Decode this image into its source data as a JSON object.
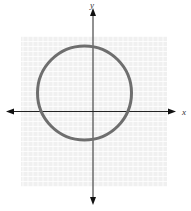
{
  "chart_data": {
    "type": "line",
    "title": "",
    "xlabel": "x",
    "ylabel": "y",
    "grid": true,
    "grid_extent_px": {
      "left": 21,
      "top": 36,
      "right": 167,
      "bottom": 187
    },
    "axes_origin_px": {
      "x": 93,
      "y": 111.5
    },
    "x_axis_px": {
      "from": 6,
      "to": 176
    },
    "y_axis_px": {
      "from": 8,
      "to": 205
    },
    "grid_minor_spacing_px": 5,
    "shape": {
      "kind": "circle",
      "center_px": {
        "x": 84.5,
        "y": 93
      },
      "radius_px": 47,
      "stroke": "#6e6e6e",
      "stroke_width": 3
    },
    "tick_labels": [],
    "legend": null
  },
  "labels": {
    "x": "x",
    "y": "y"
  },
  "colors": {
    "grid_bg": "#f0f0f0",
    "grid_line": "#ffffff",
    "axis": "#222222",
    "circle": "#6e6e6e"
  }
}
